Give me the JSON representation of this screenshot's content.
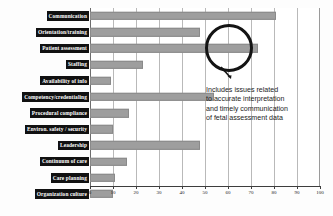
{
  "chart_data": {
    "type": "bar",
    "orientation": "horizontal",
    "title": "",
    "xlabel": "",
    "ylabel": "",
    "xlim": [
      0,
      100
    ],
    "xticks": [
      0,
      10,
      20,
      30,
      40,
      50,
      60,
      70,
      80,
      90,
      100
    ],
    "grid": true,
    "legend": null,
    "bar_color": "#9e9e9e",
    "label_box_color": "#111111",
    "label_text_color": "#ffffff",
    "categories": [
      "Communication",
      "Orientation/training",
      "Patient assessment",
      "Staffing",
      "Availability of info",
      "Competency/credentialing",
      "Procedural compliance",
      "Environ. safety / security",
      "Leadership",
      "Continuum of care",
      "Care planning",
      "Organization culture"
    ],
    "values": [
      81,
      48,
      73,
      23,
      9,
      54,
      17,
      10,
      48,
      16,
      11,
      10
    ],
    "annotations": [
      {
        "name": "patient-assessment-callout",
        "target_category": "Patient assessment",
        "shape": "circle",
        "lines": [
          "Includes issues related",
          "to accurate interpretation",
          "and timely communication",
          "of fetal assessment data"
        ]
      }
    ]
  }
}
